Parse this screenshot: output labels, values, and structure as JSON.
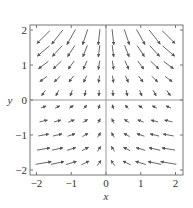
{
  "chart_data": {
    "type": "quiver",
    "title": "",
    "xlabel": "x",
    "ylabel": "y",
    "xlim": [
      -2.2,
      2.2
    ],
    "ylim": [
      -2.2,
      2.2
    ],
    "xticks": [
      -2,
      -1,
      0,
      1,
      2
    ],
    "yticks": [
      -2,
      -1,
      0,
      1,
      2
    ],
    "grid": false,
    "axes_lines": true,
    "colors": {
      "arrow": "#555555",
      "frame": "#777777",
      "axes": "#999999"
    },
    "grid_points": [
      -1.8,
      -1.4,
      -1.0,
      -0.6,
      -0.2,
      0.2,
      0.6,
      1.0,
      1.4,
      1.8
    ],
    "field_description": "Vectors point downward and outward in upper half (y>0), strongest at top corners; in lower half (y<0) vectors point toward the y-axis and slightly upward, strongest at bottom corners."
  }
}
